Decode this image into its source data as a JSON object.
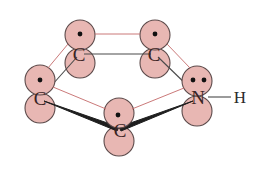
{
  "diagram": {
    "atoms": [
      {
        "id": "c_top_left",
        "label": "C",
        "electrons": 1
      },
      {
        "id": "c_top_right",
        "label": "C",
        "electrons": 1
      },
      {
        "id": "c_left",
        "label": "C",
        "electrons": 1
      },
      {
        "id": "c_bottom",
        "label": "C",
        "electrons": 1
      },
      {
        "id": "n_right",
        "label": "N",
        "electrons": 2
      }
    ],
    "substituent": {
      "label": "H",
      "attached_to": "n_right"
    },
    "colors": {
      "orbital_fill": "#e8b7b3",
      "orbital_stroke": "#5c4a4a",
      "pi_overlap_line": "#c46a6a",
      "sigma_bond": "#4a4a4a",
      "electron": "#111111"
    }
  }
}
